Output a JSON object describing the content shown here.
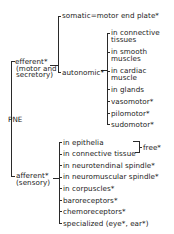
{
  "root": {
    "label": "PNE"
  },
  "efferent": {
    "label": "efferent*",
    "sub1": "(motor and",
    "sub2": "secretory)",
    "somatic": "somatic=motor end plate*",
    "autonomic": {
      "label": "autonomic*",
      "items": [
        {
          "line1": "in connective",
          "line2": "tissues"
        },
        {
          "line1": "in smooth",
          "line2": "muscles"
        },
        {
          "line1": "in cardiac",
          "line2": "muscle"
        },
        {
          "line1": "in glands"
        },
        {
          "line1": "vasomotor*"
        },
        {
          "line1": "pilomotor*"
        },
        {
          "line1": "sudomotor*"
        }
      ]
    }
  },
  "afferent": {
    "label": "afferent*",
    "sub": "(sensory)",
    "free_label": "free*",
    "items": [
      "in epithelia",
      "in connective tissue",
      "in neurotendinal spindle*",
      "in neuromuscular spindle*",
      "in corpuscles*",
      "baroreceptors*",
      "chemoreceptors*",
      "specialized (eye*, ear*)"
    ]
  }
}
